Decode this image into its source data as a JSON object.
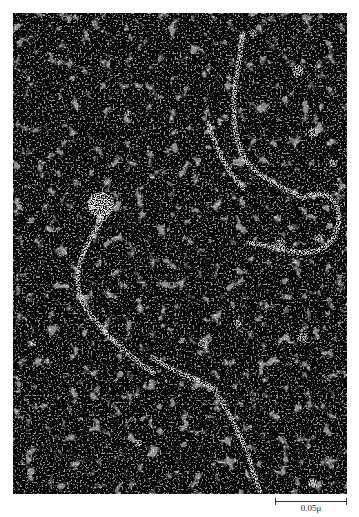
{
  "figure": {
    "type": "dark-field electron micrograph",
    "background_color": "#050505",
    "speckle_color": "#e8e8e8",
    "features": {
      "bright_particle": {
        "cx": 88,
        "cy": 192,
        "r": 13
      },
      "strands": [
        "M230,20 C225,60 215,90 225,130 C235,165 265,170 290,185",
        "M195,110 C205,140 215,160 230,175",
        "M290,185 C320,170 335,200 320,225 C300,255 260,230 235,230",
        "M95,200 C70,230 50,270 80,305 C100,330 120,345 140,360",
        "M140,345 C160,360 185,365 200,375 C215,395 225,420 235,440 C240,460 245,475 248,481"
      ]
    },
    "scale_bar": {
      "label": "0.05μ"
    }
  }
}
